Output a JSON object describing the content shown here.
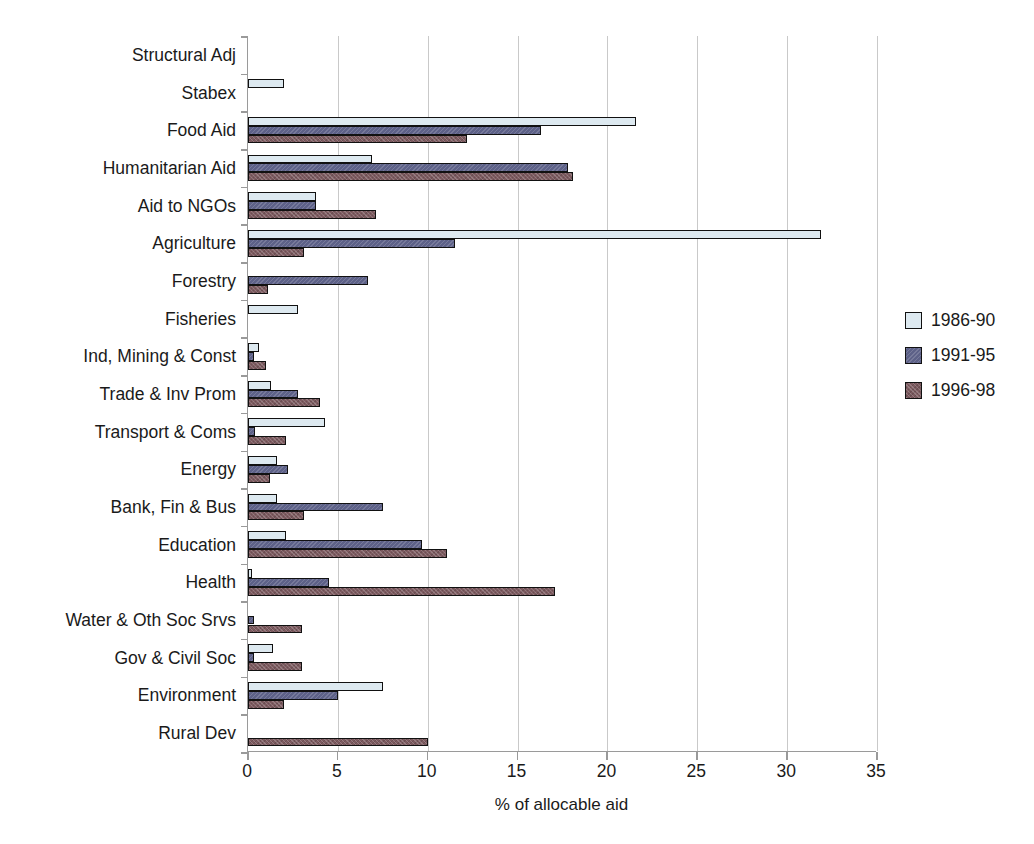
{
  "chart_data": {
    "type": "bar",
    "orientation": "horizontal",
    "title": "",
    "xlabel": "% of allocable aid",
    "ylabel": "",
    "xlim": [
      0,
      35
    ],
    "xticks": [
      0,
      5,
      10,
      15,
      20,
      25,
      30,
      35
    ],
    "grid": true,
    "legend_position": "right",
    "categories": [
      "Structural Adj",
      "Stabex",
      "Food Aid",
      "Humanitarian Aid",
      "Aid to NGOs",
      "Agriculture",
      "Forestry",
      "Fisheries",
      "Ind, Mining & Const",
      "Trade & Inv Prom",
      "Transport & Coms",
      "Energy",
      "Bank, Fin & Bus",
      "Education",
      "Health",
      "Water & Oth Soc Srvs",
      "Gov & Civil Soc",
      "Environment",
      "Rural Dev"
    ],
    "series": [
      {
        "name": "1986-90",
        "color": "#dde9f0",
        "values": [
          0,
          2.0,
          21.6,
          6.9,
          3.8,
          31.9,
          0,
          2.8,
          0.6,
          1.3,
          4.3,
          1.6,
          1.6,
          2.1,
          0.2,
          0,
          1.4,
          7.5,
          0
        ]
      },
      {
        "name": "1991-95",
        "color": "#5d6188",
        "values": [
          0,
          0,
          16.3,
          17.8,
          3.8,
          11.5,
          6.7,
          0,
          0.35,
          2.8,
          0.4,
          2.2,
          7.5,
          9.7,
          4.5,
          0.35,
          0.35,
          5.0,
          0
        ]
      },
      {
        "name": "1996-98",
        "color": "#7d5b60",
        "values": [
          0,
          0,
          12.2,
          18.1,
          7.1,
          3.1,
          1.1,
          0,
          1.0,
          4.0,
          2.1,
          1.2,
          3.1,
          11.1,
          17.1,
          3.0,
          3.0,
          2.0,
          10.0
        ]
      }
    ]
  },
  "legend": {
    "items": [
      {
        "label": "1986-90"
      },
      {
        "label": "1991-95"
      },
      {
        "label": "1996-98"
      }
    ]
  }
}
